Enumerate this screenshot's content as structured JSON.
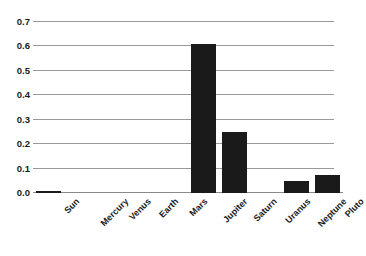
{
  "chart_data": {
    "type": "bar",
    "title": "",
    "subtitle": "",
    "xlabel": "",
    "ylabel": "",
    "categories": [
      "Sun",
      "Mercury",
      "Venus",
      "Earth",
      "Mars",
      "Jupiter",
      "Saturn",
      "Uranus",
      "Neptune",
      "Pluto"
    ],
    "values": [
      0.01,
      0.0,
      0.0,
      0.0,
      0.0,
      0.61,
      0.25,
      0.0,
      0.05,
      0.075
    ],
    "series": [
      {
        "name": "",
        "values": [
          0.01,
          0.0,
          0.0,
          0.0,
          0.0,
          0.61,
          0.25,
          0.0,
          0.05,
          0.075
        ]
      }
    ],
    "ylim": [
      0.0,
      0.7
    ],
    "yticks": [
      "0.0",
      "0.1",
      "0.2",
      "0.3",
      "0.4",
      "0.5",
      "0.6",
      "0.7"
    ],
    "ytick_values": [
      0.0,
      0.1,
      0.2,
      0.3,
      0.4,
      0.5,
      0.6,
      0.7
    ],
    "grid": "horizontal",
    "legend": "none",
    "bar_color": "#1a1a1a",
    "gridline_color": "#9a9a9a",
    "background_color": "#ffffff",
    "xtick_rotation": -45
  }
}
